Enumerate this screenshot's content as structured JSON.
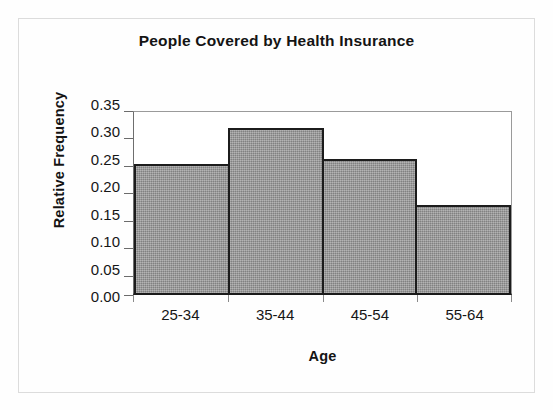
{
  "chart_data": {
    "type": "bar",
    "title": "People Covered by Health Insurance",
    "xlabel": "Age",
    "ylabel": "Relative Frequency",
    "categories": [
      "25-34",
      "35-44",
      "45-54",
      "55-64"
    ],
    "values": [
      0.25,
      0.32,
      0.26,
      0.17
    ],
    "ylim": [
      0.0,
      0.35
    ],
    "ytick_labels": [
      "0.35",
      "0.30",
      "0.25",
      "0.20",
      "0.15",
      "0.10",
      "0.05",
      "0.00"
    ],
    "ytick_values": [
      0.35,
      0.3,
      0.25,
      0.2,
      0.15,
      0.1,
      0.05,
      0.0
    ],
    "grid": false,
    "legend": "none",
    "bar_fill_color": "#929292",
    "bar_border_color": "#1c1c1c",
    "plot_frame_color": "#9a9a9a",
    "axis_color": "#1a1a1a",
    "background_color": "#fefefe"
  }
}
